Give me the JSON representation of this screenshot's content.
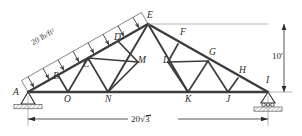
{
  "figure": {
    "type": "engineering-truss-diagram"
  },
  "load": {
    "magnitude": "20",
    "unit": "lb/ft",
    "exponent": "2",
    "full_label": "20 lb/ft²",
    "arrow_count": 8,
    "direction": "perpendicular-downward"
  },
  "dimensions": {
    "height": "10'",
    "span_number": "20",
    "span_radical": "3",
    "span_prime": "'",
    "span_full": "20√3'"
  },
  "joints": {
    "A": {
      "label": "A",
      "x": 28,
      "y": 92
    },
    "B": {
      "label": "B",
      "x": 58,
      "y": 75
    },
    "C": {
      "label": "C",
      "x": 88,
      "y": 58
    },
    "D": {
      "label": "D",
      "x": 118,
      "y": 41
    },
    "E": {
      "label": "E",
      "x": 148,
      "y": 24
    },
    "F": {
      "label": "F",
      "x": 178,
      "y": 44
    },
    "G": {
      "label": "G",
      "x": 208,
      "y": 61
    },
    "H": {
      "label": "H",
      "x": 238,
      "y": 78
    },
    "I": {
      "label": "I",
      "x": 268,
      "y": 92
    },
    "J": {
      "label": "J",
      "x": 228,
      "y": 92
    },
    "K": {
      "label": "K",
      "x": 188,
      "y": 92
    },
    "L": {
      "label": "L",
      "x": 168,
      "y": 62
    },
    "M": {
      "label": "M",
      "x": 138,
      "y": 62
    },
    "N": {
      "label": "N",
      "x": 108,
      "y": 92
    },
    "O": {
      "label": "O",
      "x": 68,
      "y": 92
    }
  },
  "supports": {
    "left": {
      "type": "pin",
      "at": "A"
    },
    "right": {
      "type": "roller",
      "at": "I"
    }
  },
  "colors": {
    "member": "#3c3c3c",
    "load_line": "#4a4a4a",
    "text": "#2b2b2b",
    "ground": "#8d8d8d"
  }
}
